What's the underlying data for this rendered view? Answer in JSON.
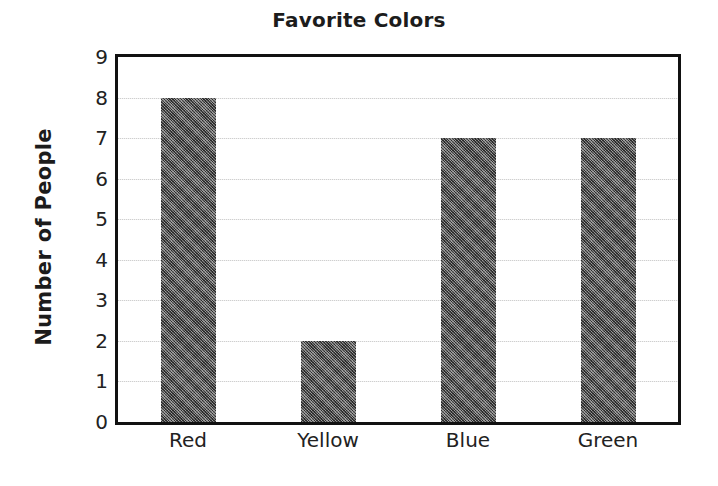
{
  "chart_data": {
    "type": "bar",
    "title": "Favorite Colors",
    "xlabel": "",
    "ylabel": "Number of People",
    "categories": [
      "Red",
      "Yellow",
      "Blue",
      "Green"
    ],
    "values": [
      8,
      2,
      7,
      7
    ],
    "ylim": [
      0,
      9
    ],
    "ytick_labels": [
      "9",
      "8",
      "7",
      "6",
      "5",
      "4",
      "3",
      "2",
      "1",
      "0"
    ],
    "ytick_values": [
      9,
      8,
      7,
      6,
      5,
      4,
      3,
      2,
      1,
      0
    ],
    "grid": true,
    "grid_axis": "y",
    "legend": false,
    "legend_position": "none",
    "bar_color": "#5a5a5a",
    "grid_color": "#cfcfcf",
    "frame_color": "#111111",
    "text_color": "#1c1c1c",
    "background_color": "#ffffff"
  }
}
